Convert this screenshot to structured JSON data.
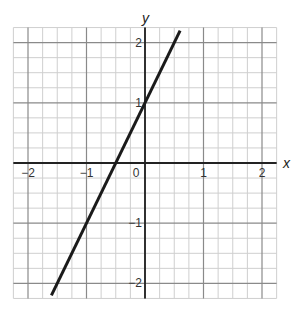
{
  "chart_data": {
    "type": "line",
    "title": "",
    "xlabel": "x",
    "ylabel": "y",
    "xlim": [
      -2.25,
      2.25
    ],
    "ylim": [
      -2.25,
      2.25
    ],
    "grid": true,
    "minor_grid_step": 0.25,
    "x_ticks": [
      -2,
      -1,
      0,
      1,
      2
    ],
    "x_tick_labels": [
      "−2",
      "−1",
      "0",
      "1",
      "2"
    ],
    "y_ticks": [
      -2,
      -1,
      1,
      2
    ],
    "y_tick_labels": [
      "−2",
      "−1",
      "1",
      "2"
    ],
    "series": [
      {
        "name": "y = 2x + 1",
        "equation": "y = 2x + 1",
        "slope": 2,
        "intercept": 1,
        "x": [
          -2.2,
          0.85
        ],
        "y": [
          -3.4,
          2.7
        ],
        "visible_x": [
          -2.15,
          0.85
        ],
        "visible_y": [
          -2.2,
          2.2
        ],
        "color": "#1a1a1a"
      }
    ],
    "legend": null
  },
  "labels": {
    "x_axis": "x",
    "y_axis": "y"
  },
  "colors": {
    "minor_grid": "#cfcfcf",
    "major_grid": "#8a8a8a",
    "axis": "#222222",
    "line": "#1a1a1a"
  }
}
